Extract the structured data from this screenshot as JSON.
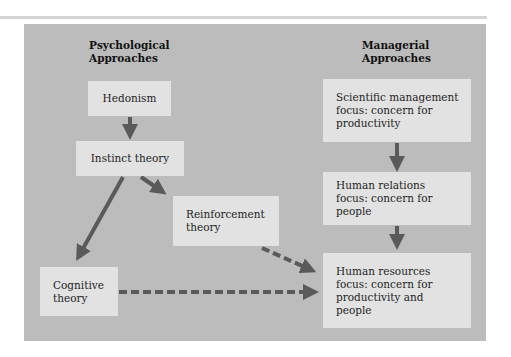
{
  "diagram": {
    "colors": {
      "panel": "#bcbcbc",
      "box": "#e2e2e2",
      "arrow": "#5a5a5a",
      "text": "#1e1e1e"
    },
    "columns": {
      "left": {
        "heading": [
          "Psychological",
          "Approaches"
        ]
      },
      "right": {
        "heading": [
          "Managerial",
          "Approaches"
        ]
      }
    },
    "nodes": {
      "hedonism": {
        "lines": [
          "Hedonism"
        ]
      },
      "instinct": {
        "lines": [
          "Instinct theory"
        ]
      },
      "reinforcement": {
        "lines": [
          "Reinforcement",
          "theory"
        ]
      },
      "cognitive": {
        "lines": [
          "Cognitive",
          "theory"
        ]
      },
      "scientific": {
        "lines": [
          "Scientific management",
          "focus: concern for",
          "productivity"
        ]
      },
      "human_relations": {
        "lines": [
          "Human relations",
          "focus: concern for",
          "people"
        ]
      },
      "human_resources": {
        "lines": [
          "Human resources",
          "focus: concern for",
          "productivity and",
          "people"
        ]
      }
    },
    "edges": [
      {
        "from": "Hedonism",
        "to": "Instinct theory",
        "style": "solid"
      },
      {
        "from": "Instinct theory",
        "to": "Reinforcement theory",
        "style": "solid"
      },
      {
        "from": "Instinct theory",
        "to": "Cognitive theory",
        "style": "solid"
      },
      {
        "from": "Scientific management",
        "to": "Human relations",
        "style": "solid"
      },
      {
        "from": "Human relations",
        "to": "Human resources",
        "style": "solid"
      },
      {
        "from": "Reinforcement theory",
        "to": "Human resources",
        "style": "dashed"
      },
      {
        "from": "Cognitive theory",
        "to": "Human resources",
        "style": "dashed"
      }
    ]
  }
}
